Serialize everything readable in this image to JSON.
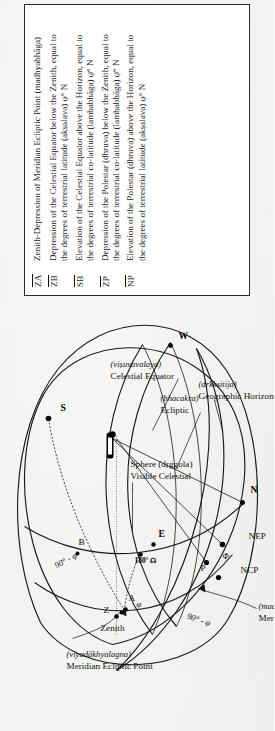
{
  "legend": {
    "entries": [
      {
        "symbol": "ZA",
        "overbar": true,
        "text_parts": [
          {
            "t": "Zenith-Depression of Meridian Ecliptic Point ("
          },
          {
            "t": "madhyabhāga",
            "i": true
          },
          {
            "t": ")"
          }
        ],
        "line1": "Zenith-Depression of Meridian Ecliptic Point (madhyabhāga)",
        "line2": ""
      },
      {
        "symbol": "ZB",
        "overbar": true,
        "line1": "Depression of the Celestial Equator below the Zenith, equal to",
        "line2": "the degrees of terrestrial latitude (akṣalava) φ° N"
      },
      {
        "symbol": "SB",
        "overbar": true,
        "line1": "Elevation of the Celestial Equator above the Horizon, equal to",
        "line2": "the degrees of terrestrial co-latitude (lambabhāga) φ̄° N"
      },
      {
        "symbol": "ZP",
        "overbar": true,
        "line1": "Depression of the Polestar (dhruva) below the Zenith, equal to",
        "line2": "the degrees of terrestrial co-latitude (lambabhāga) φ̄° N"
      },
      {
        "symbol": "NP",
        "overbar": true,
        "line1": "Elevation of the Polestar (dhruva) above the Horizon, equal to",
        "line2": "the degrees of terrestrial latitude (akṣalava) φ° N"
      }
    ],
    "italic_terms": [
      "madhyabhāga",
      "akṣalava",
      "lambabhāga",
      "dhruva"
    ]
  },
  "diagram": {
    "callouts": [
      {
        "id": "meridian-ecliptic-point",
        "line1": "Meridian Ecliptic Point",
        "line2": "(viyadākhyalagna)"
      },
      {
        "id": "visible-celestial-sphere",
        "line1": "Visible Celestial",
        "line2": "Sphere (dṛggola)"
      },
      {
        "id": "ecliptic",
        "line1": "Ecliptic",
        "line2": "(bhacakra)"
      },
      {
        "id": "celestial-equator",
        "line1": "Celestial Equator",
        "line2": "(viṣuvavalaya)"
      },
      {
        "id": "geographic-horizon",
        "line1": "Geographic Horizon",
        "line2": "(dṛkkṣitija)"
      },
      {
        "id": "meridian",
        "line1": "Meridian",
        "line2": "(madhyāhnavṛtta)"
      }
    ],
    "point_labels": [
      {
        "id": "zenith",
        "text": "Zenith"
      },
      {
        "id": "z",
        "text": "Z"
      },
      {
        "id": "a",
        "text": "A"
      },
      {
        "id": "b",
        "text": "B"
      },
      {
        "id": "s",
        "text": "S"
      },
      {
        "id": "w",
        "text": "W"
      },
      {
        "id": "n",
        "text": "N"
      },
      {
        "id": "e",
        "text": "E"
      },
      {
        "id": "p",
        "text": "P"
      },
      {
        "id": "ncp",
        "text": "NCP"
      },
      {
        "id": "nep",
        "text": "NEP"
      }
    ],
    "angle_labels": [
      {
        "id": "arc-90-minus-phi-upper",
        "text": "90° - φ"
      },
      {
        "id": "arc-90-minus-phi-lower",
        "text": "90° - φ"
      },
      {
        "id": "phi-upper",
        "text": "φ"
      },
      {
        "id": "phi-lower",
        "text": "Φ"
      },
      {
        "id": "node-180",
        "text": "180° ☊"
      }
    ]
  }
}
